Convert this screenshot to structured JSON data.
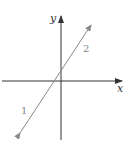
{
  "diagram": {
    "axes": {
      "x_label": "x",
      "y_label": "y",
      "axis_color": "#333333"
    },
    "line": {
      "color": "#888888",
      "direction_labels": [
        "1",
        "2"
      ],
      "description": "Straight line with arrows at both ends, positive slope, crossing x-axis left of origin and y-axis above origin"
    }
  }
}
